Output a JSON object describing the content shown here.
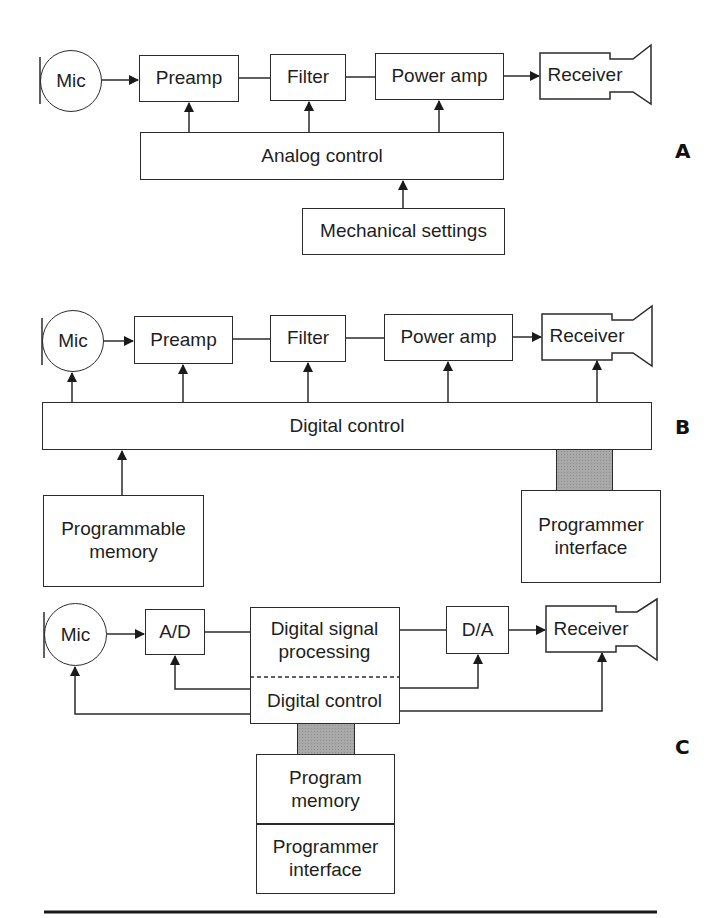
{
  "panels": [
    {
      "id": "A",
      "label": "A",
      "mic": "Mic",
      "chain": [
        "Preamp",
        "Filter",
        "Power amp",
        "Receiver"
      ],
      "control": "Analog control",
      "input": "Mechanical settings"
    },
    {
      "id": "B",
      "label": "B",
      "mic": "Mic",
      "chain": [
        "Preamp",
        "Filter",
        "Power amp",
        "Receiver"
      ],
      "control": "Digital control",
      "memory": "Programmable\nmemory",
      "interface": "Programmer\ninterface"
    },
    {
      "id": "C",
      "label": "C",
      "mic": "Mic",
      "chain": [
        "A/D",
        "D/A",
        "Receiver"
      ],
      "dsp": "Digital signal\nprocessing",
      "control": "Digital control",
      "memory": "Program\nmemory",
      "interface": "Programmer\ninterface"
    }
  ],
  "colors": {
    "line": "#2b2b2b",
    "text": "#1e1e1e",
    "shaded": "#a9a9a9",
    "background": "#ffffff"
  }
}
